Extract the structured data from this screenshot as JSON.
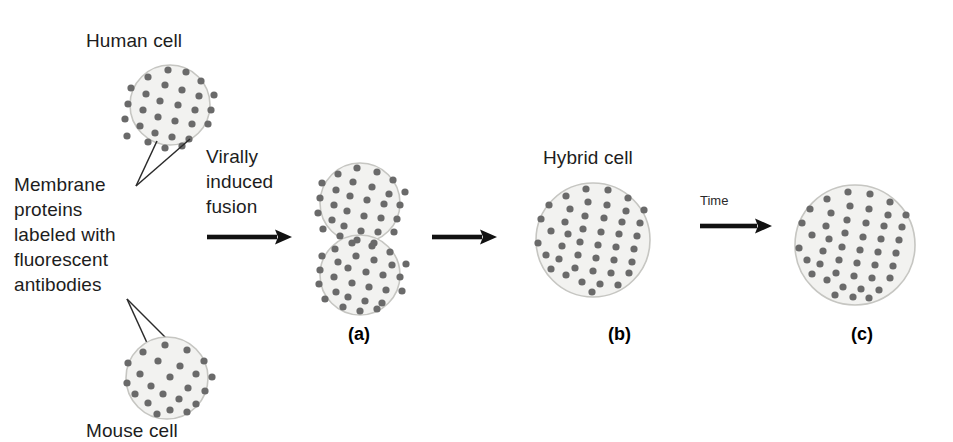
{
  "figure": {
    "width": 953,
    "height": 442,
    "background": "#ffffff",
    "title_caption": "Virally induced fusion of human and mouse cells demonstrating membrane protein diffusion"
  },
  "colors": {
    "cell_fill": "#f2f2f0",
    "cell_border": "#c6c6c2",
    "protein_dot": "#6a6a6a",
    "arrow": "#111111",
    "leader_line": "#2b2b2b",
    "text": "#1d1d1d"
  },
  "labels": {
    "human_cell": "Human cell",
    "membrane_proteins": "Membrane\nproteins\nlabeled with\nfluorescent\nantibodies",
    "mouse_cell": "Mouse cell",
    "virally_induced_fusion": "Virally\ninduced\nfusion",
    "hybrid_cell": "Hybrid cell",
    "time": "Time",
    "panel_a": "(a)",
    "panel_b": "(b)",
    "panel_c": "(c)"
  },
  "cells": {
    "human": {
      "name": "human-cell",
      "cx": 170,
      "cy": 105,
      "r": 40,
      "dot_count": 29,
      "dots": [
        [
          168,
          70
        ],
        [
          186,
          72
        ],
        [
          148,
          77
        ],
        [
          201,
          81
        ],
        [
          131,
          88
        ],
        [
          165,
          85
        ],
        [
          182,
          90
        ],
        [
          146,
          94
        ],
        [
          199,
          96
        ],
        [
          214,
          95
        ],
        [
          128,
          104
        ],
        [
          160,
          101
        ],
        [
          178,
          105
        ],
        [
          195,
          110
        ],
        [
          211,
          110
        ],
        [
          143,
          110
        ],
        [
          125,
          119
        ],
        [
          158,
          117
        ],
        [
          175,
          121
        ],
        [
          192,
          124
        ],
        [
          208,
          124
        ],
        [
          140,
          126
        ],
        [
          127,
          136
        ],
        [
          155,
          133
        ],
        [
          172,
          137
        ],
        [
          189,
          139
        ],
        [
          148,
          142
        ],
        [
          165,
          148
        ],
        [
          182,
          146
        ]
      ]
    },
    "mouse": {
      "name": "mouse-cell",
      "cx": 167,
      "cy": 378,
      "r": 41,
      "dot_count": 23,
      "dots": [
        [
          165,
          345
        ],
        [
          187,
          350
        ],
        [
          143,
          352
        ],
        [
          204,
          361
        ],
        [
          128,
          363
        ],
        [
          158,
          361
        ],
        [
          180,
          366
        ],
        [
          196,
          374
        ],
        [
          140,
          374
        ],
        [
          212,
          377
        ],
        [
          170,
          377
        ],
        [
          127,
          383
        ],
        [
          151,
          386
        ],
        [
          188,
          388
        ],
        [
          205,
          391
        ],
        [
          135,
          394
        ],
        [
          163,
          394
        ],
        [
          179,
          399
        ],
        [
          148,
          403
        ],
        [
          196,
          404
        ],
        [
          170,
          410
        ],
        [
          187,
          412
        ],
        [
          157,
          414
        ]
      ]
    },
    "fused_top": {
      "name": "fused-cell-top",
      "cx": 360,
      "cy": 203,
      "r": 40,
      "dot_count": 30,
      "dots": [
        [
          357,
          168
        ],
        [
          377,
          172
        ],
        [
          338,
          174
        ],
        [
          393,
          180
        ],
        [
          322,
          183
        ],
        [
          353,
          182
        ],
        [
          372,
          187
        ],
        [
          336,
          190
        ],
        [
          389,
          194
        ],
        [
          405,
          192
        ],
        [
          320,
          198
        ],
        [
          350,
          196
        ],
        [
          367,
          200
        ],
        [
          384,
          204
        ],
        [
          400,
          205
        ],
        [
          334,
          205
        ],
        [
          318,
          213
        ],
        [
          347,
          211
        ],
        [
          364,
          216
        ],
        [
          381,
          218
        ],
        [
          397,
          219
        ],
        [
          332,
          220
        ],
        [
          323,
          229
        ],
        [
          344,
          226
        ],
        [
          361,
          231
        ],
        [
          378,
          232
        ],
        [
          394,
          232
        ],
        [
          340,
          236
        ],
        [
          357,
          240
        ],
        [
          374,
          243
        ]
      ]
    },
    "fused_bottom": {
      "name": "fused-cell-bottom",
      "cx": 360,
      "cy": 275,
      "r": 40,
      "dot_count": 29,
      "dots": [
        [
          352,
          243
        ],
        [
          372,
          246
        ],
        [
          335,
          249
        ],
        [
          390,
          252
        ],
        [
          322,
          256
        ],
        [
          356,
          256
        ],
        [
          374,
          260
        ],
        [
          338,
          262
        ],
        [
          392,
          265
        ],
        [
          406,
          264
        ],
        [
          320,
          270
        ],
        [
          348,
          268
        ],
        [
          366,
          272
        ],
        [
          383,
          275
        ],
        [
          400,
          277
        ],
        [
          334,
          277
        ],
        [
          319,
          284
        ],
        [
          352,
          283
        ],
        [
          369,
          287
        ],
        [
          386,
          290
        ],
        [
          402,
          291
        ],
        [
          336,
          292
        ],
        [
          325,
          299
        ],
        [
          348,
          297
        ],
        [
          365,
          301
        ],
        [
          382,
          303
        ],
        [
          343,
          307
        ],
        [
          360,
          311
        ],
        [
          377,
          309
        ]
      ]
    },
    "hybrid": {
      "name": "hybrid-cell",
      "cx": 593,
      "cy": 240,
      "r": 57,
      "dot_count": 44,
      "dots": [
        [
          586,
          189
        ],
        [
          608,
          190
        ],
        [
          566,
          196
        ],
        [
          628,
          198
        ],
        [
          549,
          205
        ],
        [
          588,
          202
        ],
        [
          607,
          205
        ],
        [
          570,
          209
        ],
        [
          626,
          211
        ],
        [
          644,
          210
        ],
        [
          541,
          219
        ],
        [
          585,
          216
        ],
        [
          604,
          218
        ],
        [
          622,
          222
        ],
        [
          640,
          223
        ],
        [
          565,
          222
        ],
        [
          551,
          231
        ],
        [
          583,
          229
        ],
        [
          601,
          232
        ],
        [
          619,
          234
        ],
        [
          637,
          236
        ],
        [
          568,
          234
        ],
        [
          538,
          243
        ],
        [
          580,
          242
        ],
        [
          598,
          245
        ],
        [
          616,
          247
        ],
        [
          634,
          249
        ],
        [
          562,
          246
        ],
        [
          546,
          255
        ],
        [
          578,
          255
        ],
        [
          596,
          258
        ],
        [
          614,
          260
        ],
        [
          632,
          262
        ],
        [
          559,
          259
        ],
        [
          551,
          269
        ],
        [
          575,
          268
        ],
        [
          593,
          271
        ],
        [
          611,
          273
        ],
        [
          629,
          273
        ],
        [
          566,
          275
        ],
        [
          582,
          282
        ],
        [
          600,
          284
        ],
        [
          618,
          285
        ],
        [
          592,
          292
        ]
      ]
    },
    "equilibrated": {
      "name": "equilibrated-hybrid-cell",
      "cx": 855,
      "cy": 245,
      "r": 60,
      "dot_count": 46,
      "dots": [
        [
          848,
          192
        ],
        [
          870,
          194
        ],
        [
          827,
          199
        ],
        [
          890,
          202
        ],
        [
          810,
          209
        ],
        [
          850,
          206
        ],
        [
          869,
          209
        ],
        [
          831,
          213
        ],
        [
          888,
          215
        ],
        [
          906,
          215
        ],
        [
          802,
          223
        ],
        [
          847,
          220
        ],
        [
          866,
          223
        ],
        [
          884,
          226
        ],
        [
          902,
          227
        ],
        [
          826,
          226
        ],
        [
          812,
          235
        ],
        [
          845,
          233
        ],
        [
          863,
          237
        ],
        [
          881,
          239
        ],
        [
          899,
          240
        ],
        [
          829,
          239
        ],
        [
          799,
          248
        ],
        [
          842,
          247
        ],
        [
          860,
          250
        ],
        [
          878,
          252
        ],
        [
          896,
          253
        ],
        [
          823,
          251
        ],
        [
          807,
          260
        ],
        [
          839,
          260
        ],
        [
          857,
          263
        ],
        [
          875,
          265
        ],
        [
          893,
          266
        ],
        [
          820,
          264
        ],
        [
          812,
          274
        ],
        [
          836,
          273
        ],
        [
          854,
          276
        ],
        [
          872,
          278
        ],
        [
          890,
          278
        ],
        [
          827,
          280
        ],
        [
          843,
          287
        ],
        [
          861,
          289
        ],
        [
          879,
          290
        ],
        [
          853,
          297
        ],
        [
          835,
          295
        ],
        [
          869,
          298
        ]
      ]
    }
  },
  "arrows": [
    {
      "name": "fusion-arrow",
      "x1": 207,
      "y1": 237,
      "x2": 292,
      "y2": 237
    },
    {
      "name": "hybrid-arrow",
      "x1": 432,
      "y1": 237,
      "x2": 497,
      "y2": 237
    },
    {
      "name": "time-arrow",
      "x1": 700,
      "y1": 226,
      "x2": 772,
      "y2": 226
    }
  ],
  "leaders": {
    "upper": {
      "name": "membrane-protein-leader-upper",
      "apex": [
        136,
        186
      ],
      "targets": [
        [
          157,
          141
        ],
        [
          190,
          139
        ]
      ]
    },
    "lower": {
      "name": "membrane-protein-leader-lower",
      "apex": [
        127,
        299
      ],
      "targets": [
        [
          148,
          345
        ],
        [
          170,
          342
        ]
      ]
    }
  }
}
